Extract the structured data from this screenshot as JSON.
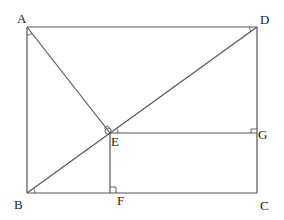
{
  "diagram": {
    "type": "geometry",
    "points": {
      "A": {
        "label": "A",
        "x": 27,
        "y": 27
      },
      "D": {
        "label": "D",
        "x": 257,
        "y": 27
      },
      "B": {
        "label": "B",
        "x": 27,
        "y": 193
      },
      "C": {
        "label": "C",
        "x": 257,
        "y": 193
      },
      "E": {
        "label": "E",
        "x": 110,
        "y": 133
      },
      "F": {
        "label": "F",
        "x": 110,
        "y": 193
      },
      "G": {
        "label": "G",
        "x": 257,
        "y": 133
      }
    },
    "segments": [
      "AD",
      "AB",
      "BC",
      "DC",
      "BD",
      "AE",
      "EF",
      "EG"
    ],
    "right_angle_marks": [
      "AEB",
      "EFB",
      "EGD"
    ],
    "angle_marks": [
      "BAE",
      "ADB",
      "DBC",
      "DEG"
    ]
  }
}
